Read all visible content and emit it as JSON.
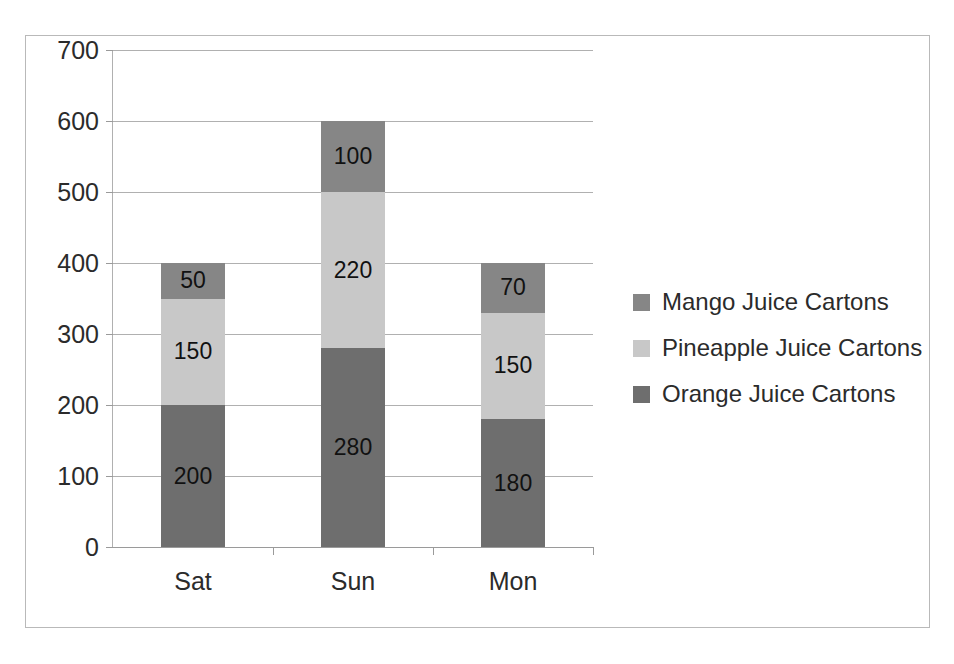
{
  "chart_data": {
    "type": "bar",
    "subtype": "stacked-column",
    "title": "",
    "xlabel": "",
    "ylabel": "",
    "categories": [
      "Sat",
      "Sun",
      "Mon"
    ],
    "series": [
      {
        "name": "Orange Juice Cartons",
        "color": "#6e6e6e",
        "values": [
          200,
          280,
          180
        ]
      },
      {
        "name": "Pineapple Juice Cartons",
        "color": "#c8c8c8",
        "values": [
          150,
          220,
          150
        ]
      },
      {
        "name": "Mango Juice Cartons",
        "color": "#868686",
        "values": [
          50,
          100,
          70
        ]
      }
    ],
    "stack_order_bottom_to_top": [
      "Orange Juice Cartons",
      "Pineapple Juice Cartons",
      "Mango Juice Cartons"
    ],
    "totals": [
      400,
      600,
      400
    ],
    "ylim": [
      0,
      700
    ],
    "ytick_step": 100,
    "yticks": [
      0,
      100,
      200,
      300,
      400,
      500,
      600,
      700
    ],
    "ytick_labels": [
      "0",
      "100",
      "200",
      "300",
      "400",
      "500",
      "600",
      "700"
    ],
    "data_labels_shown": true,
    "grid": {
      "horizontal": true,
      "vertical": false,
      "color": "#b0b0b0"
    },
    "legend": {
      "position": "right",
      "entries": [
        {
          "label": "Mango Juice Cartons",
          "color": "#868686"
        },
        {
          "label": "Pineapple Juice Cartons",
          "color": "#c8c8c8"
        },
        {
          "label": "Orange Juice Cartons",
          "color": "#6e6e6e"
        }
      ]
    },
    "bars": [
      {
        "category": "Sat",
        "total": 400,
        "segments": [
          {
            "series": "Orange Juice Cartons",
            "value": 200,
            "label": "200",
            "color": "#6e6e6e"
          },
          {
            "series": "Pineapple Juice Cartons",
            "value": 150,
            "label": "150",
            "color": "#c8c8c8"
          },
          {
            "series": "Mango Juice Cartons",
            "value": 50,
            "label": "50",
            "color": "#868686"
          }
        ]
      },
      {
        "category": "Sun",
        "total": 600,
        "segments": [
          {
            "series": "Orange Juice Cartons",
            "value": 280,
            "label": "280",
            "color": "#6e6e6e"
          },
          {
            "series": "Pineapple Juice Cartons",
            "value": 220,
            "label": "220",
            "color": "#c8c8c8"
          },
          {
            "series": "Mango Juice Cartons",
            "value": 100,
            "label": "100",
            "color": "#868686"
          }
        ]
      },
      {
        "category": "Mon",
        "total": 400,
        "segments": [
          {
            "series": "Orange Juice Cartons",
            "value": 180,
            "label": "180",
            "color": "#6e6e6e"
          },
          {
            "series": "Pineapple Juice Cartons",
            "value": 150,
            "label": "150",
            "color": "#c8c8c8"
          },
          {
            "series": "Mango Juice Cartons",
            "value": 70,
            "label": "70",
            "color": "#868686"
          }
        ]
      }
    ]
  },
  "style": {
    "plot_background": "#ffffff",
    "frame_border": "#b9b9b9",
    "axis_color": "#9a9a9a",
    "text_color": "#2b2b2b",
    "label_text_color": "#111111"
  }
}
